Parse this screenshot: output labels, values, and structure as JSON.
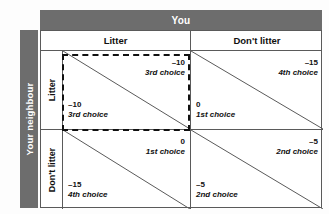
{
  "column_axis": {
    "label": "You",
    "headers": [
      "Litter",
      "Don't  litter"
    ]
  },
  "row_axis": {
    "label": "Your neighbour",
    "headers": [
      "Litter",
      "Don't  litter"
    ]
  },
  "colors": {
    "header_bar": "#6d6d6d",
    "header_text": "#ffffff",
    "grid_line": "#5a5a5a",
    "dash_box": "#111111",
    "cell_background": "#ffffff"
  },
  "cells": {
    "litter_litter": {
      "you": {
        "value": "–10",
        "rank": "3rd choice"
      },
      "neighbour": {
        "value": "–10",
        "rank": "3rd choice"
      },
      "highlighted": true
    },
    "litter_dontlitter": {
      "you": {
        "value": "–15",
        "rank": "4th choice"
      },
      "neighbour": {
        "value": "0",
        "rank": "1st choice"
      },
      "highlighted": false
    },
    "dontlitter_litter": {
      "you": {
        "value": "0",
        "rank": "1st choice"
      },
      "neighbour": {
        "value": "–15",
        "rank": "4th choice"
      },
      "highlighted": false
    },
    "dontlitter_dontlitter": {
      "you": {
        "value": "–5",
        "rank": "2nd choice"
      },
      "neighbour": {
        "value": "–5",
        "rank": "2nd choice"
      },
      "highlighted": false
    }
  }
}
